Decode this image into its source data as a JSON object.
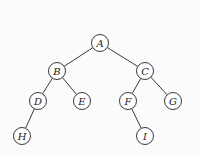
{
  "diagram": {
    "type": "binary-tree",
    "node_radius": 8.5,
    "nodes": [
      {
        "id": "A",
        "label": "A",
        "x": 100,
        "y": 43
      },
      {
        "id": "B",
        "label": "B",
        "x": 57,
        "y": 71
      },
      {
        "id": "C",
        "label": "C",
        "x": 145,
        "y": 71
      },
      {
        "id": "D",
        "label": "D",
        "x": 38,
        "y": 101
      },
      {
        "id": "E",
        "label": "E",
        "x": 82,
        "y": 101
      },
      {
        "id": "F",
        "label": "F",
        "x": 128,
        "y": 101
      },
      {
        "id": "G",
        "label": "G",
        "x": 173,
        "y": 101
      },
      {
        "id": "H",
        "label": "H",
        "x": 22,
        "y": 136
      },
      {
        "id": "I",
        "label": "I",
        "x": 145,
        "y": 136
      }
    ],
    "edges": [
      {
        "from": "A",
        "to": "B"
      },
      {
        "from": "A",
        "to": "C"
      },
      {
        "from": "B",
        "to": "D"
      },
      {
        "from": "B",
        "to": "E"
      },
      {
        "from": "C",
        "to": "F"
      },
      {
        "from": "C",
        "to": "G"
      },
      {
        "from": "D",
        "to": "H"
      },
      {
        "from": "F",
        "to": "I"
      }
    ]
  }
}
